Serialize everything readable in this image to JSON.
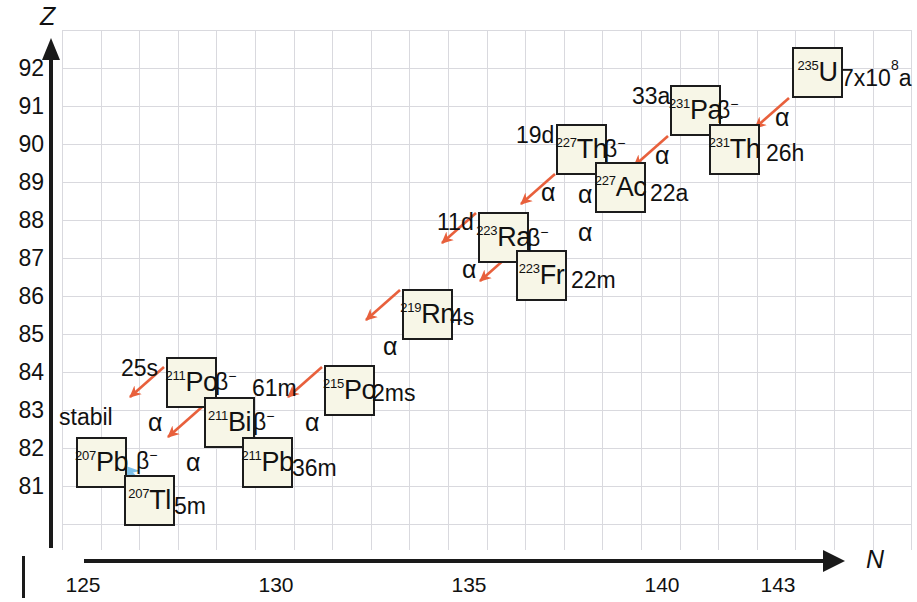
{
  "chart_data": {
    "type": "diagram",
    "xlabel": "N",
    "ylabel": "Z",
    "xticks": [
      125,
      130,
      135,
      140,
      143
    ],
    "yticks": [
      92,
      91,
      90,
      89,
      88,
      87,
      86,
      85,
      84,
      83,
      82,
      81
    ],
    "xlim": [
      124,
      143
    ],
    "ylim": [
      80,
      92
    ],
    "grid": true,
    "alpha_color": "#e8603c",
    "beta_color": "#6fb7e8",
    "box_fill": "#f7f6e7",
    "nuclides": [
      {
        "mass": "235",
        "symbol": "U",
        "halflife": "7x10⁸a",
        "Z": 92,
        "N": 143,
        "decay": "alpha"
      },
      {
        "mass": "231",
        "symbol": "Th",
        "halflife": "26h",
        "Z": 90,
        "N": 141,
        "decay": "beta"
      },
      {
        "mass": "231",
        "symbol": "Pa",
        "halflife": "33a",
        "Z": 91,
        "N": 140,
        "decay": "alpha"
      },
      {
        "mass": "227",
        "symbol": "Ac",
        "halflife": "22a",
        "Z": 89,
        "N": 138,
        "decay": "beta"
      },
      {
        "mass": "227",
        "symbol": "Th",
        "halflife": "19d",
        "Z": 90,
        "N": 137,
        "decay": "alpha"
      },
      {
        "mass": "223",
        "symbol": "Fr",
        "halflife": "22m",
        "Z": 87,
        "N": 136,
        "decay": "beta"
      },
      {
        "mass": "223",
        "symbol": "Ra",
        "halflife": "11d",
        "Z": 88,
        "N": 135,
        "decay": "alpha"
      },
      {
        "mass": "219",
        "symbol": "Rn",
        "halflife": "4s",
        "Z": 86,
        "N": 133,
        "decay": "alpha"
      },
      {
        "mass": "215",
        "symbol": "Po",
        "halflife": "2ms",
        "Z": 84,
        "N": 131,
        "decay": "alpha"
      },
      {
        "mass": "211",
        "symbol": "Pb",
        "halflife": "36m",
        "Z": 82,
        "N": 129,
        "decay": "beta"
      },
      {
        "mass": "211",
        "symbol": "Bi",
        "halflife": "61m",
        "Z": 83,
        "N": 128,
        "decay": "alpha"
      },
      {
        "mass": "211",
        "symbol": "Po",
        "halflife": "25s",
        "Z": 84,
        "N": 127,
        "decay": "alpha"
      },
      {
        "mass": "207",
        "symbol": "Tl",
        "halflife": "5m",
        "Z": 81,
        "N": 126,
        "decay": "beta"
      },
      {
        "mass": "207",
        "symbol": "Pb",
        "halflife": "stabil",
        "Z": 82,
        "N": 125,
        "decay": "none"
      }
    ],
    "decay_labels": {
      "alpha": "α",
      "beta": "β⁻"
    }
  },
  "axes": {
    "y_name": "Z",
    "x_name": "N",
    "y_ticks": [
      "92",
      "91",
      "90",
      "89",
      "88",
      "87",
      "86",
      "85",
      "84",
      "83",
      "82",
      "81"
    ],
    "x_ticks": [
      "125",
      "130",
      "135",
      "140",
      "143"
    ]
  },
  "boxes": {
    "u235": {
      "mass": "235",
      "symbol": "U"
    },
    "pa231": {
      "mass": "231",
      "symbol": "Pa"
    },
    "th231": {
      "mass": "231",
      "symbol": "Th"
    },
    "th227": {
      "mass": "227",
      "symbol": "Th"
    },
    "ac227": {
      "mass": "227",
      "symbol": "Ac"
    },
    "ra223": {
      "mass": "223",
      "symbol": "Ra"
    },
    "fr223": {
      "mass": "223",
      "symbol": "Fr"
    },
    "rn219": {
      "mass": "219",
      "symbol": "Rn"
    },
    "po215": {
      "mass": "215",
      "symbol": "Po"
    },
    "po211": {
      "mass": "211",
      "symbol": "Po"
    },
    "bi211": {
      "mass": "211",
      "symbol": "Bi"
    },
    "pb211": {
      "mass": "211",
      "symbol": "Pb"
    },
    "pb207": {
      "mass": "207",
      "symbol": "Pb"
    },
    "tl207": {
      "mass": "207",
      "symbol": "Tl"
    }
  },
  "halflives": {
    "u235": "7x10",
    "u235_exp": "8",
    "u235_suffix": "a",
    "pa231": "33a",
    "th231": "26h",
    "th227": "19d",
    "ac227": "22a",
    "ra223": "11d",
    "fr223": "22m",
    "rn219": "4s",
    "po215": "2ms",
    "po211": "25s",
    "bi211": "61m",
    "pb211": "36m",
    "tl207": "5m",
    "pb207": "stabil"
  },
  "decay": {
    "alpha": "α",
    "beta": "β",
    "beta_sup": "−"
  }
}
